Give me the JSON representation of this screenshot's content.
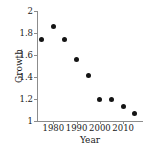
{
  "chart_data": {
    "type": "scatter",
    "title": "",
    "xlabel": "Year",
    "ylabel": "Growth",
    "xlim": [
      1973,
      2018.5
    ],
    "ylim": [
      1,
      2
    ],
    "grid": false,
    "legend": null,
    "marker": {
      "shape": "circle",
      "color": "#141414",
      "size_px": 5
    },
    "axis_color": "#8c8c8c",
    "x_ticks": [
      1980,
      1990,
      2000,
      2010
    ],
    "x_tick_labels": [
      "1980",
      "1990",
      "2000",
      "2010"
    ],
    "y_ticks": [
      1,
      1.2,
      1.4,
      1.6,
      1.8,
      2
    ],
    "y_tick_labels": [
      "1",
      "1.2",
      "1.4",
      "1.6",
      "1.8",
      "2"
    ],
    "x": [
      1975,
      1980,
      1985,
      1990,
      1995,
      2000,
      2005,
      2010,
      2015
    ],
    "values": [
      1.74,
      1.86,
      1.74,
      1.56,
      1.41,
      1.2,
      1.2,
      1.13,
      1.07
    ],
    "points": [
      {
        "x": 1975,
        "y": 1.74
      },
      {
        "x": 1980,
        "y": 1.86
      },
      {
        "x": 1985,
        "y": 1.74
      },
      {
        "x": 1990,
        "y": 1.56
      },
      {
        "x": 1995,
        "y": 1.41
      },
      {
        "x": 2000,
        "y": 1.2
      },
      {
        "x": 2005,
        "y": 1.2
      },
      {
        "x": 2010,
        "y": 1.13
      },
      {
        "x": 2015,
        "y": 1.07
      }
    ]
  }
}
